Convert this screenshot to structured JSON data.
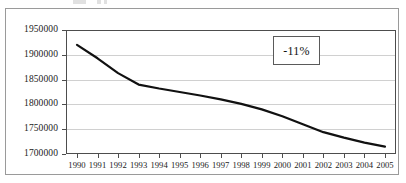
{
  "figure": {
    "background_color": "#ffffff",
    "frame_color": "#9a9a9a",
    "axis_color": "#4d4d4d",
    "grid_color": "#d0d0d0",
    "series_color": "#111111"
  },
  "annotation": {
    "label": "-11%",
    "border_color": "#5a5a5a"
  },
  "chart_data": {
    "type": "line",
    "title": "",
    "subtitle": "",
    "xlabel": "",
    "ylabel": "",
    "x": [
      1990,
      1991,
      1992,
      1993,
      1994,
      1995,
      1996,
      1997,
      1998,
      1999,
      2000,
      2001,
      2002,
      2003,
      2004,
      2005
    ],
    "categories": [
      "1990",
      "1991",
      "1992",
      "1993",
      "1994",
      "1995",
      "1996",
      "1997",
      "1998",
      "1999",
      "2000",
      "2001",
      "2002",
      "2003",
      "2004",
      "2005"
    ],
    "values": [
      1920000,
      1893000,
      1863000,
      1840000,
      1832000,
      1825000,
      1818000,
      1810000,
      1801000,
      1790000,
      1776000,
      1760000,
      1744000,
      1733000,
      1723000,
      1715000
    ],
    "series": [
      {
        "name": "",
        "values": [
          1920000,
          1893000,
          1863000,
          1840000,
          1832000,
          1825000,
          1818000,
          1810000,
          1801000,
          1790000,
          1776000,
          1760000,
          1744000,
          1733000,
          1723000,
          1715000
        ]
      }
    ],
    "ylim": [
      1700000,
      1950000
    ],
    "yticks": [
      1950000,
      1900000,
      1850000,
      1800000,
      1750000,
      1700000
    ],
    "ytick_labels": [
      "1950000",
      "1900000",
      "1850000",
      "1800000",
      "1750000",
      "1700000"
    ],
    "xtick_labels": [
      "1990",
      "1991",
      "1992",
      "1993",
      "1994",
      "1995",
      "1996",
      "1997",
      "1998",
      "1999",
      "2000",
      "2001",
      "2002",
      "2003",
      "2004",
      "2005"
    ],
    "grid": "horizontal",
    "legend": "none",
    "annotations": [
      {
        "text": "-11%",
        "x": 2001,
        "y": 1912000
      }
    ]
  }
}
